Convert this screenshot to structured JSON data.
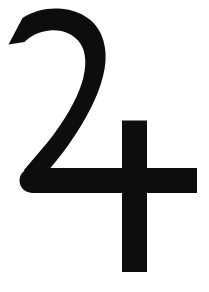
{
  "image": {
    "kind": "symbol-glyph",
    "name": "jupiter-symbol",
    "character": "♃",
    "title": "Jupiter astronomical symbol",
    "width": 209,
    "height": 292,
    "background_color": "#ffffff",
    "ink_color": "#0d0d0d"
  },
  "glyph": {
    "description": "Black Jupiter planetary symbol: a numeral-two-like hook stroke crossed by a bold cross bar",
    "strokes": [
      {
        "name": "hook-arc",
        "role": "upper curved hook resembling the numeral 2",
        "terminal_left": "angled flat cut",
        "bbox": [
          8,
          9,
          105,
          195
        ]
      },
      {
        "name": "descending-diagonal",
        "role": "diagonal descending from hook right side down to the left baseline",
        "bbox": [
          30,
          88,
          106,
          194
        ]
      },
      {
        "name": "horizontal-bar",
        "role": "baseline horizontal bar with rounded left terminal",
        "left_terminal": "round",
        "right_terminal": "flat",
        "bbox": [
          20,
          168,
          197,
          193
        ]
      },
      {
        "name": "vertical-bar",
        "role": "vertical stem of the cross",
        "bbox": [
          122,
          120,
          147,
          272
        ]
      }
    ],
    "paths": {
      "hook": "M 8.5 44.5 L 22.5 18.0 C 33.0 11.0 46.0 8.0 58.0 8.5 C 78.0 9.3 94.5 19.0 101.0 34.0 C 108.5 51.0 106.5 70.0 98.0 92.0 C 90.0 113.0 74.0 139.0 57.0 160.0 L 33.0 189.0 L 24.0 170.0 L 47.0 143.0 C 64.0 122.0 76.0 101.0 81.5 84.0 C 87.0 67.0 86.5 52.0 80.0 43.0 C 73.5 34.0 62.0 29.5 50.0 30.5 C 40.0 31.3 31.0 35.5 24.5 42.0 Z",
      "horizontal_bar": "M 33.5 168.0 L 197.0 168.0 L 197.0 193.0 L 33.5 193.0 C 25.0 193.0 19.5 187.5 19.5 180.5 C 19.5 173.5 25.0 168.0 33.5 168.0 Z",
      "vertical_bar": "M 122.0 120.5 L 147.0 120.5 L 147.0 272.0 L 122.0 272.0 Z"
    }
  }
}
